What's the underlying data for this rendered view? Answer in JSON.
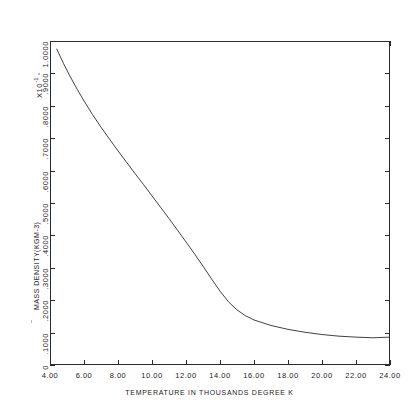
{
  "chart_data": {
    "type": "line",
    "title": "",
    "xlabel": "TEMPERATURE IN THOUSANDS DEGREE K",
    "ylabel": "MASS DENSITY(KGM-3)",
    "y_multiplier": "X10",
    "y_multiplier_exponent": "-1",
    "xlim": [
      4.0,
      24.0
    ],
    "ylim": [
      0.0,
      1.0
    ],
    "grid": false,
    "legend": null,
    "xticks": [
      4.0,
      6.0,
      8.0,
      10.0,
      12.0,
      14.0,
      16.0,
      18.0,
      20.0,
      22.0,
      24.0
    ],
    "xtick_labels": [
      "4.00",
      "6.00",
      "8.00",
      "10.00",
      "12.00",
      "14.00",
      "16.00",
      "18.00",
      "20.00",
      "22.00",
      "24.00"
    ],
    "yticks": [
      0.0,
      0.1,
      0.2,
      0.3,
      0.4,
      0.5,
      0.6,
      0.7,
      0.8,
      0.9,
      1.0
    ],
    "ytick_labels": [
      "0",
      ".1000",
      ".2000",
      ".3000",
      ".4000",
      ".5000",
      ".6000",
      ".7000",
      ".8000",
      ".9000",
      "1.0000"
    ],
    "series": [
      {
        "name": "mass density",
        "color": "#2b2b2b",
        "x": [
          4.4,
          4.8,
          5.2,
          5.6,
          6.0,
          6.5,
          7.0,
          7.5,
          8.0,
          8.5,
          9.0,
          9.5,
          10.0,
          10.5,
          11.0,
          11.5,
          12.0,
          12.5,
          13.0,
          13.5,
          14.0,
          14.5,
          15.0,
          15.5,
          16.0,
          17.0,
          18.0,
          19.0,
          20.0,
          21.0,
          22.0,
          23.0,
          24.0
        ],
        "y": [
          0.975,
          0.93,
          0.889,
          0.851,
          0.815,
          0.773,
          0.734,
          0.697,
          0.661,
          0.626,
          0.591,
          0.557,
          0.522,
          0.487,
          0.452,
          0.416,
          0.38,
          0.343,
          0.305,
          0.266,
          0.228,
          0.195,
          0.17,
          0.152,
          0.139,
          0.122,
          0.11,
          0.101,
          0.094,
          0.089,
          0.086,
          0.084,
          0.086
        ]
      }
    ]
  },
  "axes": {
    "y_title": "MASS DENSITY(KGM-3)",
    "x_title": "TEMPERATURE IN THOUSANDS DEGREE K",
    "y_multiplier_text": "X10",
    "y_multiplier_exp": "-1"
  }
}
